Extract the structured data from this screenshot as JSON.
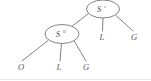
{
  "figure": {
    "caption": "",
    "background_color": "#ffffff",
    "stroke_color": "#6b6b6b",
    "text_color": "#4a4a4a",
    "width": 151,
    "height": 81
  },
  "tree": {
    "type": "parse-tree",
    "nodes": [
      {
        "id": "root",
        "label": "S",
        "superscript": "s",
        "shape": "ellipse",
        "cx": 103,
        "cy": 9,
        "rx": 16.5,
        "ry": 9
      },
      {
        "id": "inner",
        "label": "S",
        "superscript": "0",
        "shape": "ellipse",
        "cx": 62,
        "cy": 34,
        "rx": 17,
        "ry": 9.5
      }
    ],
    "leaves": [
      {
        "id": "leaf-o",
        "label": "O",
        "x": 21,
        "y": 70
      },
      {
        "id": "leaf-l-lower",
        "label": "L",
        "x": 59,
        "y": 70
      },
      {
        "id": "leaf-g-lower",
        "label": "G",
        "x": 86,
        "y": 70
      },
      {
        "id": "leaf-l-upper",
        "label": "L",
        "x": 102,
        "y": 40
      },
      {
        "id": "leaf-g-upper",
        "label": "G",
        "x": 134,
        "y": 40
      }
    ],
    "edges": [
      {
        "id": "edge-root-inner",
        "from": "root",
        "to": "inner",
        "x1": 88.5,
        "y1": 13.5,
        "x2": 70.5,
        "y2": 27.5
      },
      {
        "id": "edge-root-l",
        "from": "root",
        "to": "leaf-l-upper",
        "x1": 103,
        "y1": 18,
        "x2": 102.5,
        "y2": 31
      },
      {
        "id": "edge-root-g",
        "from": "root",
        "to": "leaf-g-upper",
        "x1": 116,
        "y1": 15.5,
        "x2": 133,
        "y2": 31
      },
      {
        "id": "edge-inner-o",
        "from": "inner",
        "to": "leaf-o",
        "x1": 48,
        "y1": 40.5,
        "x2": 22,
        "y2": 61
      },
      {
        "id": "edge-inner-l",
        "from": "inner",
        "to": "leaf-l-lower",
        "x1": 61.5,
        "y1": 43.5,
        "x2": 60,
        "y2": 61
      },
      {
        "id": "edge-inner-g",
        "from": "inner",
        "to": "leaf-g-lower",
        "x1": 74.5,
        "y1": 41.5,
        "x2": 86,
        "y2": 61
      }
    ]
  }
}
